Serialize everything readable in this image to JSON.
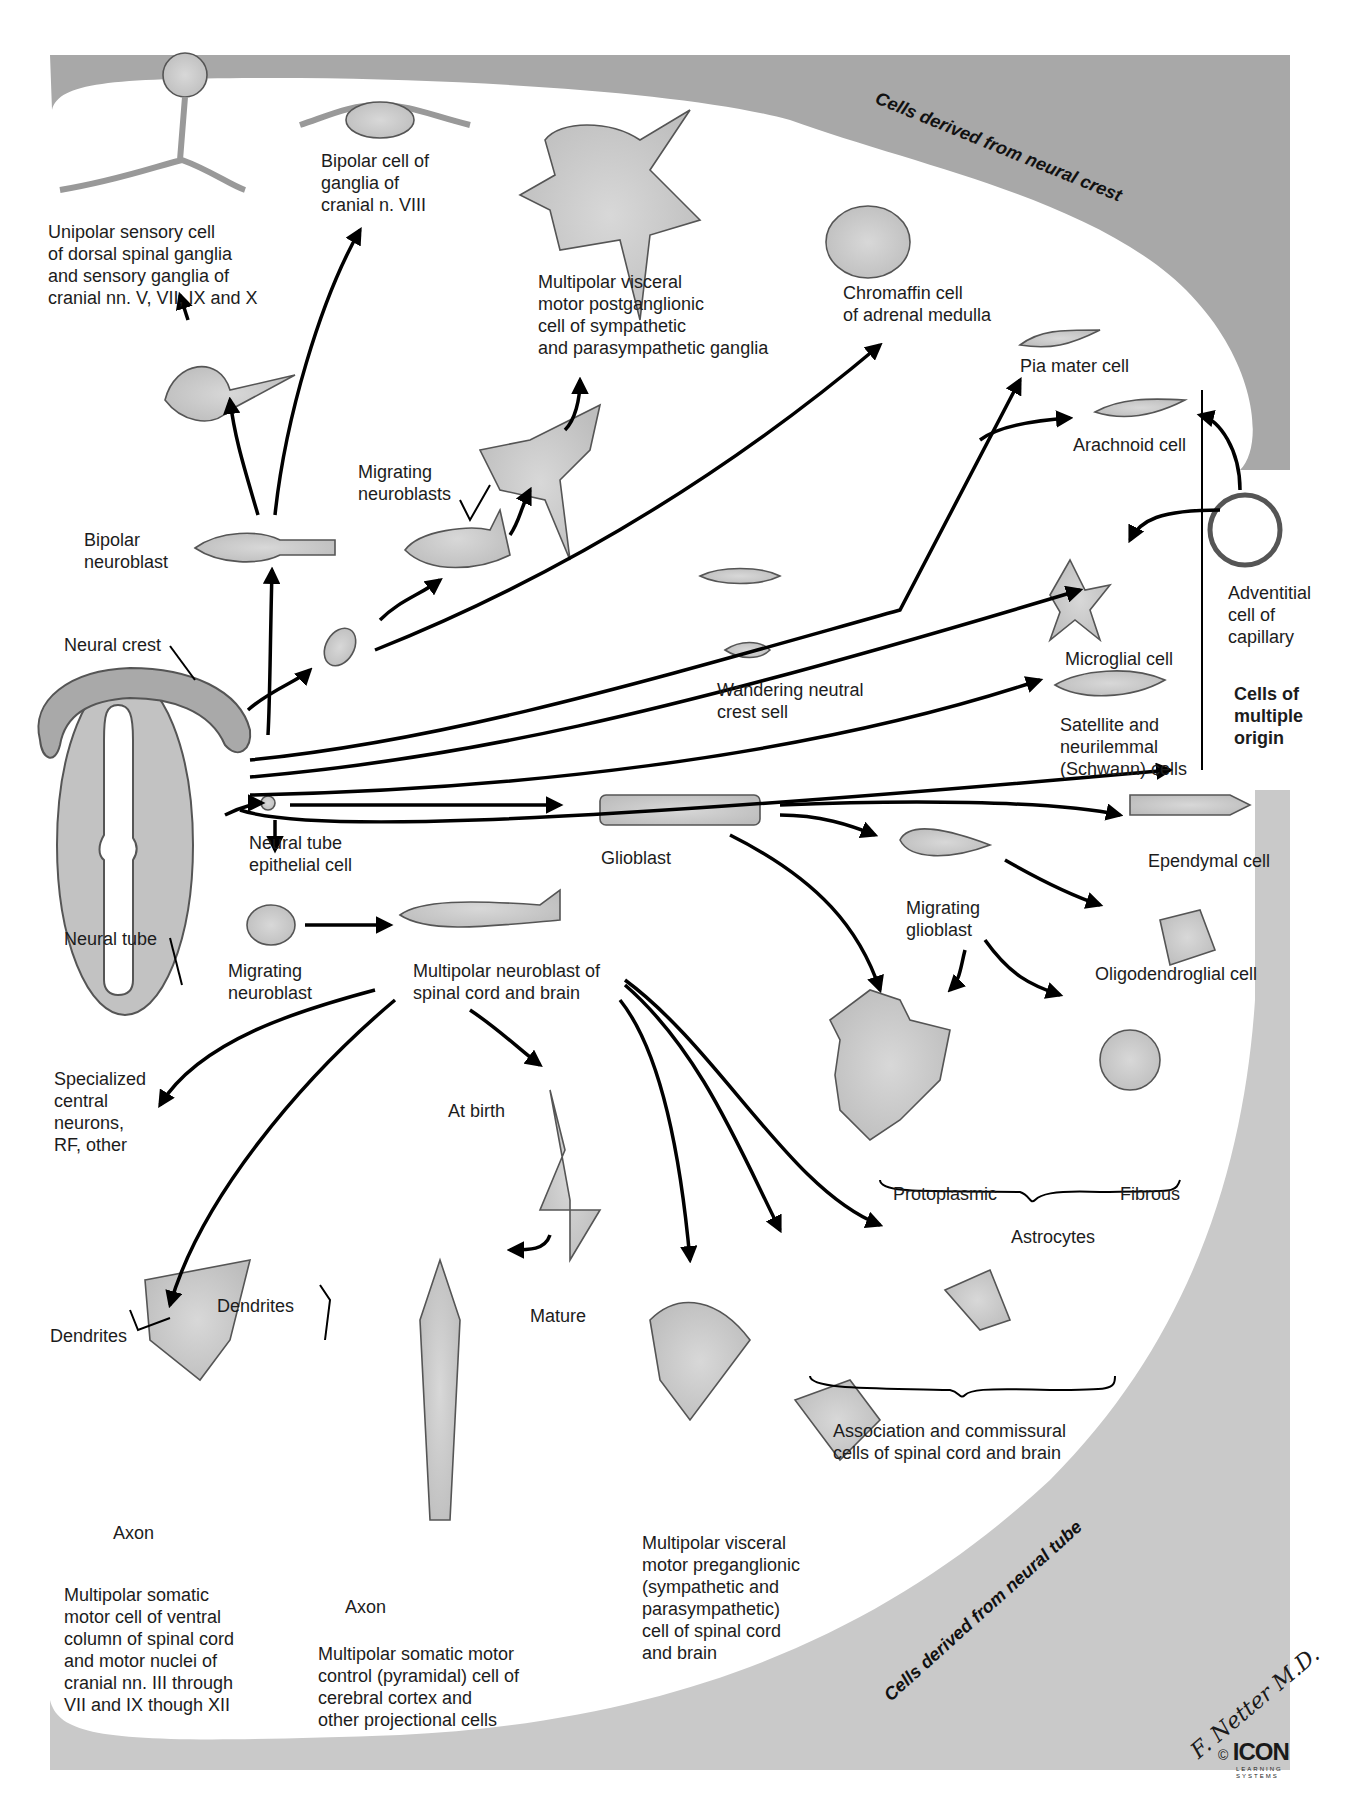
{
  "figure": {
    "regions": {
      "neural_crest_banner": "Cells derived from neural crest",
      "neural_tube_banner": "Cells derived from neural tube",
      "multiple_origin": "Cells of\nmultiple\norigin"
    },
    "colors": {
      "background_band": "#a9a9a9",
      "panel": "#ffffff",
      "cell_fill": "#cfcfcf",
      "cell_stroke": "#555555",
      "arrow": "#000000"
    },
    "origins": {
      "neural_crest": "Neural crest",
      "neural_tube": "Neural tube",
      "neural_tube_epithelial": "Neural tube\nepithelial cell"
    },
    "crest_cells": {
      "unipolar": "Unipolar sensory cell\nof dorsal spinal ganglia\nand sensory ganglia of\ncranial nn. V, VII, IX and X",
      "bipolar_viii": "Bipolar cell of\nganglia of\ncranial n. VIII",
      "multipolar_visceral_post": "Multipolar visceral\nmotor postganglionic\ncell of sympathetic\nand parasympathetic ganglia",
      "chromaffin": "Chromaffin cell\nof adrenal medulla",
      "pia": "Pia mater cell",
      "arachnoid": "Arachnoid cell",
      "bipolar_neuroblast": "Bipolar\nneuroblast",
      "migrating_neuroblasts": "Migrating\nneuroblasts",
      "wandering": "Wandering neutral\ncrest sell"
    },
    "multiple_origin_cells": {
      "adventitial": "Adventitial\ncell of\ncapillary",
      "microglial": "Microglial cell",
      "satellite": "Satellite and\nneurilemmal\n(Schwann) cells"
    },
    "tube_cells": {
      "glioblast": "Glioblast",
      "ependymal": "Ependymal cell",
      "migrating_glioblast": "Migrating\nglioblast",
      "oligodendroglial": "Oligodendroglial cell",
      "protoplasmic": "Protoplasmic",
      "fibrous": "Fibrous",
      "astrocytes": "Astrocytes",
      "migrating_neuroblast": "Migrating\nneuroblast",
      "multipolar_neuroblast": "Multipolar neuroblast of\nspinal cord and brain",
      "specialized": "Specialized\ncentral\nneurons,\nRF, other",
      "at_birth": "At birth",
      "mature": "Mature",
      "dendrites_a": "Dendrites",
      "dendrites_b": "Dendrites",
      "axon_a": "Axon",
      "axon_b": "Axon",
      "somatic_motor": "Multipolar somatic\nmotor cell of ventral\ncolumn of spinal cord\nand motor nuclei of\ncranial nn. III through\nVII and IX though XII",
      "pyramidal": "Multipolar somatic motor\ncontrol (pyramidal) cell of\ncerebral cortex and\nother projectional cells",
      "visceral_pre": "Multipolar visceral\nmotor preganglionic\n(sympathetic and\nparasympathetic)\ncell of spinal cord\nand brain",
      "association": "Association and commissural\ncells of spinal cord and brain"
    },
    "credits": {
      "signature": "F. Netter M.D.",
      "copyright": "©",
      "publisher": "ICON",
      "publisher_sub": "LEARNING\nSYSTEMS"
    }
  }
}
